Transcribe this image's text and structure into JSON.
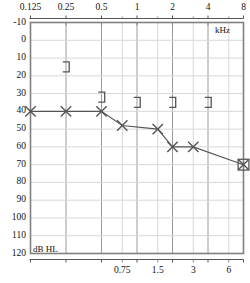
{
  "chart_data": {
    "type": "line",
    "title": "",
    "subtitle": "",
    "xlabel": "kHz",
    "ylabel": "dB HL",
    "grid": true,
    "legend": "none",
    "x_scale": "log2",
    "xlim": [
      0.125,
      8
    ],
    "ylim": [
      -10,
      120
    ],
    "y_invert": true,
    "x_major_ticks": [
      "0.125",
      "0.25",
      "0.5",
      "1",
      "2",
      "4",
      "8"
    ],
    "x_major_values": [
      0.125,
      0.25,
      0.5,
      1,
      2,
      4,
      8
    ],
    "x_minor_ticks": [
      "0.75",
      "1.5",
      "3",
      "6"
    ],
    "x_minor_values": [
      0.75,
      1.5,
      3,
      6
    ],
    "y_ticks": [
      "-10",
      "0",
      "10",
      "20",
      "30",
      "40",
      "50",
      "60",
      "70",
      "80",
      "90",
      "100",
      "110",
      "120"
    ],
    "y_values": [
      -10,
      0,
      10,
      20,
      30,
      40,
      50,
      60,
      70,
      80,
      90,
      100,
      110,
      120
    ],
    "series": [
      {
        "name": "air-conduction-left",
        "marker": "x",
        "connected": true,
        "color": "#555555",
        "points": [
          {
            "x": 0.125,
            "y": 40
          },
          {
            "x": 0.25,
            "y": 40
          },
          {
            "x": 0.5,
            "y": 40
          },
          {
            "x": 0.75,
            "y": 48
          },
          {
            "x": 1.5,
            "y": 50
          },
          {
            "x": 2,
            "y": 60
          },
          {
            "x": 3,
            "y": 60
          },
          {
            "x": 8,
            "y": 70
          }
        ]
      },
      {
        "name": "bone-conduction-masked",
        "marker": "bracket-right",
        "connected": false,
        "color": "#555555",
        "points": [
          {
            "x": 0.25,
            "y": 15
          },
          {
            "x": 0.5,
            "y": 32
          },
          {
            "x": 1,
            "y": 35
          },
          {
            "x": 2,
            "y": 35
          },
          {
            "x": 4,
            "y": 35
          }
        ]
      },
      {
        "name": "no-response-marker",
        "marker": "square",
        "connected": false,
        "color": "#555555",
        "points": [
          {
            "x": 8,
            "y": 70
          }
        ]
      }
    ]
  },
  "axes": {
    "frequency_unit": "kHz",
    "level_unit": "dB HL"
  },
  "colors": {
    "frame": "#808080",
    "grid_major": "#9a9a9a",
    "grid_minor": "#d8d8d8",
    "marker": "#555555",
    "line": "#666666",
    "background": "#ffffff"
  }
}
